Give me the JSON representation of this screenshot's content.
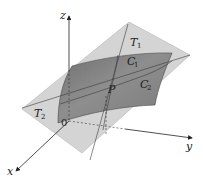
{
  "figure": {
    "colors": {
      "background": "#ffffff",
      "tangent_plane": "#cfcfcf",
      "surface": "#8a8a8a",
      "surface_edge": "#4a4a4a",
      "axis": "#222222",
      "line": "#3a3a3a"
    },
    "axes": {
      "x_label": "x",
      "y_label": "y",
      "z_label": "z",
      "origin_label": "0"
    },
    "labels": {
      "T1": "T",
      "T1_sub": "1",
      "T2": "T",
      "T2_sub": "2",
      "C1": "C",
      "C1_sub": "1",
      "C2": "C",
      "C2_sub": "2",
      "P": "P"
    }
  }
}
